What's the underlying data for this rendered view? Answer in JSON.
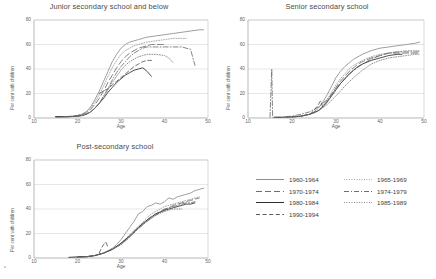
{
  "figure": {
    "axis_label_x": "Age",
    "axis_label_y": "Per cent with children",
    "xticks": [
      "10",
      "20",
      "30",
      "40",
      "50"
    ],
    "yticks": [
      "0",
      "20",
      "40",
      "60",
      "80"
    ]
  },
  "legend": {
    "entries": [
      {
        "label": "1960-1964",
        "style": "solid",
        "color": "#8d8d8d",
        "column": 0,
        "row": 0
      },
      {
        "label": "1970-1974",
        "style": "longdash",
        "color": "#6e6e6e",
        "column": 0,
        "row": 1
      },
      {
        "label": "1980-1984",
        "style": "solid",
        "color": "#2f2f2f",
        "column": 0,
        "row": 2
      },
      {
        "label": "1990-1994",
        "style": "dash",
        "color": "#5a5a5a",
        "column": 0,
        "row": 3
      },
      {
        "label": "1965-1969",
        "style": "dotted",
        "color": "#9a9a9a",
        "column": 1,
        "row": 0
      },
      {
        "label": "1974-1979",
        "style": "dashdot",
        "color": "#707070",
        "column": 1,
        "row": 1
      },
      {
        "label": "1985-1989",
        "style": "dotted",
        "color": "#7d7d7d",
        "column": 1,
        "row": 2
      }
    ]
  },
  "chart_data": [
    {
      "type": "line",
      "title": "Junior secondary school and below",
      "xlabel": "Age",
      "ylabel": "Per cent with children",
      "xlim": [
        10,
        50
      ],
      "ylim": [
        0,
        80
      ],
      "grid": true,
      "legend_position": "external-bottom-right",
      "series": [
        {
          "name": "1960-1964",
          "style": "solid",
          "color": "#8d8d8d",
          "x": [
            15,
            17,
            19,
            20,
            21,
            22,
            23,
            24,
            25,
            26,
            27,
            28,
            29,
            30,
            31,
            32,
            33,
            34,
            35,
            36,
            38,
            40,
            42,
            44,
            46,
            48,
            49
          ],
          "y": [
            1,
            1,
            1.5,
            2,
            3,
            5,
            9,
            15,
            22,
            30,
            38,
            46,
            52,
            57,
            60,
            62,
            63,
            64,
            65,
            66,
            67,
            68,
            69,
            70,
            71,
            72,
            72
          ]
        },
        {
          "name": "1965-1969",
          "style": "dotted",
          "color": "#9a9a9a",
          "x": [
            15,
            17,
            19,
            20,
            21,
            22,
            23,
            24,
            25,
            26,
            27,
            28,
            29,
            30,
            31,
            32,
            33,
            34,
            36,
            38,
            40,
            42,
            44,
            45
          ],
          "y": [
            1,
            1,
            1.5,
            2,
            3,
            5,
            8,
            13,
            19,
            26,
            34,
            41,
            47,
            52,
            55,
            57,
            59,
            60,
            62,
            63,
            64,
            65,
            65,
            65
          ]
        },
        {
          "name": "1970-1974",
          "style": "longdash",
          "color": "#6e6e6e",
          "x": [
            15,
            17,
            19,
            20,
            21,
            22,
            23,
            24,
            25,
            26,
            27,
            28,
            29,
            30,
            31,
            32,
            33,
            34,
            35,
            36,
            37,
            38,
            39,
            40
          ],
          "y": [
            1,
            1,
            1.5,
            2,
            3,
            4,
            7,
            11,
            16,
            22,
            29,
            35,
            41,
            46,
            50,
            53,
            55,
            57,
            58,
            59,
            60,
            60,
            60,
            60
          ]
        },
        {
          "name": "1974-1979",
          "style": "dashdot",
          "color": "#707070",
          "x": [
            15,
            18,
            20,
            21,
            22,
            23,
            24,
            25,
            26,
            27,
            28,
            29,
            30,
            31,
            32,
            33,
            34,
            35,
            36,
            37,
            38,
            40,
            42,
            44,
            46,
            47
          ],
          "y": [
            1,
            1,
            1.5,
            2,
            3,
            5,
            8,
            12,
            18,
            24,
            31,
            37,
            42,
            46,
            50,
            53,
            55,
            57,
            58,
            58,
            58,
            58,
            58,
            58,
            56,
            43
          ]
        },
        {
          "name": "1980-1984",
          "style": "solid",
          "color": "#2f2f2f",
          "x": [
            15,
            17,
            19,
            20,
            21,
            22,
            23,
            24,
            25,
            26,
            27,
            28,
            29,
            30,
            31,
            32,
            33,
            34,
            35,
            36,
            37
          ],
          "y": [
            1,
            1,
            1.2,
            1.5,
            2,
            3,
            5,
            8,
            12,
            16,
            21,
            25,
            29,
            32,
            35,
            37,
            39,
            40,
            41,
            38,
            34
          ]
        },
        {
          "name": "1985-1989",
          "style": "dotted",
          "color": "#7d7d7d",
          "x": [
            17,
            19,
            21,
            22,
            23,
            24,
            25,
            26,
            27,
            28,
            29,
            30,
            31,
            32,
            33,
            34,
            35,
            36,
            38,
            40,
            41,
            42
          ],
          "y": [
            1,
            1.2,
            2,
            3,
            5,
            8,
            12,
            17,
            23,
            29,
            34,
            39,
            43,
            46,
            48,
            50,
            51,
            52,
            52,
            51,
            49,
            45
          ]
        },
        {
          "name": "1990-1994",
          "style": "dash",
          "color": "#5a5a5a",
          "x": [
            25,
            26,
            27,
            28,
            29,
            30,
            31,
            32,
            33,
            34,
            35,
            36,
            37
          ],
          "y": [
            20,
            22,
            24,
            27,
            30,
            33,
            36,
            39,
            42,
            44,
            46,
            47,
            47
          ]
        }
      ]
    },
    {
      "type": "line",
      "title": "Senior secondary school",
      "xlabel": "Age",
      "ylabel": "Per cent with children",
      "xlim": [
        10,
        50
      ],
      "ylim": [
        0,
        80
      ],
      "grid": true,
      "series": [
        {
          "name": "1960-1964",
          "style": "solid",
          "color": "#8d8d8d",
          "x": [
            16,
            18,
            20,
            22,
            24,
            25,
            26,
            27,
            28,
            29,
            30,
            31,
            32,
            33,
            34,
            35,
            36,
            38,
            40,
            42,
            44,
            46,
            48,
            49
          ],
          "y": [
            0.5,
            0.5,
            0.8,
            1.5,
            3,
            5,
            8,
            13,
            19,
            26,
            33,
            38,
            42,
            45,
            48,
            50,
            52,
            55,
            57,
            58,
            59,
            60,
            61,
            62
          ]
        },
        {
          "name": "1965-1969",
          "style": "dotted",
          "color": "#9a9a9a",
          "x": [
            16,
            18,
            20,
            22,
            24,
            25,
            26,
            27,
            28,
            29,
            30,
            31,
            32,
            33,
            34,
            35,
            36,
            38,
            40,
            42,
            44,
            46,
            48,
            49
          ],
          "y": [
            0.5,
            0.5,
            0.8,
            1.5,
            3,
            4,
            6,
            10,
            15,
            21,
            27,
            32,
            36,
            40,
            43,
            45,
            47,
            50,
            52,
            53,
            54,
            55,
            55,
            55
          ]
        },
        {
          "name": "1970-1974",
          "style": "longdash",
          "color": "#6e6e6e",
          "x": [
            16,
            18,
            20,
            22,
            24,
            26,
            27,
            28,
            29,
            30,
            31,
            32,
            33,
            34,
            35,
            36,
            38,
            40,
            42,
            44,
            46,
            48,
            49
          ],
          "y": [
            0.5,
            0.5,
            0.8,
            1.5,
            3,
            6,
            9,
            14,
            19,
            25,
            30,
            34,
            38,
            41,
            44,
            46,
            49,
            51,
            53,
            53,
            53,
            53,
            53
          ]
        },
        {
          "name": "1974-1979",
          "style": "dashdot",
          "color": "#707070",
          "x": [
            15,
            15.4,
            15.6,
            16,
            18,
            20,
            22,
            24,
            26,
            28,
            30,
            32,
            34,
            36,
            38,
            40,
            42,
            44,
            46,
            48,
            49
          ],
          "y": [
            0.5,
            40,
            0.5,
            0.5,
            0.8,
            1.5,
            3,
            5,
            9,
            15,
            24,
            32,
            39,
            44,
            48,
            51,
            53,
            54,
            54,
            54,
            54
          ]
        },
        {
          "name": "1980-1984",
          "style": "solid",
          "color": "#2f2f2f",
          "x": [
            16,
            18,
            20,
            22,
            24,
            26,
            27,
            28,
            29,
            30,
            31,
            32,
            33,
            34,
            35,
            36,
            38,
            40,
            42,
            44,
            45
          ],
          "y": [
            0.5,
            0.5,
            0.8,
            1.5,
            3,
            6,
            9,
            13,
            18,
            23,
            28,
            32,
            36,
            39,
            42,
            44,
            47,
            49,
            51,
            52,
            52
          ]
        },
        {
          "name": "1985-1989",
          "style": "dotted",
          "color": "#7d7d7d",
          "x": [
            18,
            20,
            22,
            24,
            26,
            28,
            30,
            32,
            34,
            36,
            38,
            40,
            42,
            44,
            46,
            48,
            49
          ],
          "y": [
            0.5,
            0.8,
            1.5,
            3,
            6,
            11,
            18,
            26,
            33,
            39,
            44,
            47,
            49,
            50,
            51,
            52,
            52
          ]
        },
        {
          "name": "1990-1994",
          "style": "dash",
          "color": "#5a5a5a",
          "x": [
            24,
            25,
            26,
            26.5,
            27
          ],
          "y": [
            3,
            6,
            11,
            14,
            9
          ]
        }
      ]
    },
    {
      "type": "line",
      "title": "Post-secondary school",
      "xlabel": "Age",
      "ylabel": "Per cent with children",
      "xlim": [
        10,
        50
      ],
      "ylim": [
        0,
        80
      ],
      "grid": true,
      "series": [
        {
          "name": "1960-1964",
          "style": "solid",
          "color": "#8d8d8d",
          "x": [
            18,
            20,
            22,
            24,
            26,
            28,
            29,
            30,
            31,
            32,
            33,
            34,
            35,
            36,
            37,
            38,
            39,
            40,
            41,
            42,
            43,
            44,
            45,
            46,
            47,
            48,
            49
          ],
          "y": [
            0.5,
            0.8,
            1,
            2,
            4,
            8,
            11,
            15,
            20,
            25,
            30,
            36,
            38,
            42,
            43,
            45,
            44,
            46,
            49,
            48,
            50,
            51,
            52,
            53,
            55,
            56,
            57
          ]
        },
        {
          "name": "1965-1969",
          "style": "dotted",
          "color": "#9a9a9a",
          "x": [
            20,
            22,
            24,
            26,
            28,
            30,
            32,
            34,
            35,
            36,
            37,
            38,
            39,
            40,
            41,
            42,
            43,
            44,
            45,
            46,
            47,
            48
          ],
          "y": [
            0.8,
            1,
            2,
            4,
            7,
            12,
            19,
            26,
            29,
            33,
            36,
            38,
            40,
            42,
            43,
            44,
            45,
            46,
            47,
            48,
            49,
            50
          ]
        },
        {
          "name": "1970-1974",
          "style": "longdash",
          "color": "#6e6e6e",
          "x": [
            20,
            22,
            24,
            26,
            28,
            30,
            32,
            34,
            36,
            37,
            38,
            39,
            40,
            41,
            42,
            43,
            44,
            45,
            46,
            47,
            48
          ],
          "y": [
            0.8,
            1,
            2,
            4,
            7,
            12,
            18,
            25,
            31,
            34,
            36,
            38,
            40,
            41,
            43,
            44,
            45,
            46,
            47,
            48,
            49
          ]
        },
        {
          "name": "1974-1979",
          "style": "dashdot",
          "color": "#707070",
          "x": [
            20,
            22,
            24,
            26,
            28,
            30,
            32,
            34,
            36,
            38,
            40,
            41,
            42,
            43,
            44,
            45,
            46,
            47
          ],
          "y": [
            0.8,
            1,
            2,
            4,
            7,
            11,
            17,
            24,
            30,
            35,
            39,
            41,
            42,
            43,
            44,
            45,
            45,
            46
          ]
        },
        {
          "name": "1980-1984",
          "style": "solid",
          "color": "#2f2f2f",
          "x": [
            18,
            20,
            22,
            24,
            26,
            28,
            30,
            32,
            34,
            36,
            38,
            40,
            42,
            44,
            45,
            46,
            47
          ],
          "y": [
            0.5,
            0.8,
            1,
            2,
            4,
            7,
            12,
            18,
            25,
            31,
            36,
            39,
            41,
            43,
            44,
            44,
            45
          ]
        },
        {
          "name": "1985-1989",
          "style": "dotted",
          "color": "#7d7d7d",
          "x": [
            22,
            24,
            26,
            28,
            30,
            32,
            34,
            36,
            38,
            40,
            41,
            42,
            43,
            44
          ],
          "y": [
            1,
            2,
            4,
            7,
            11,
            17,
            24,
            30,
            35,
            38,
            39,
            40,
            40,
            40
          ]
        },
        {
          "name": "1990-1994",
          "style": "dash",
          "color": "#5a5a5a",
          "x": [
            25,
            25.5,
            26,
            26.5,
            27
          ],
          "y": [
            4,
            8,
            11,
            13,
            9
          ]
        }
      ]
    }
  ]
}
